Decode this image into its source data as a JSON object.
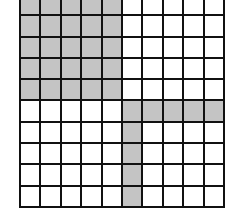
{
  "grid": {
    "rows": 10,
    "cols": 10,
    "line_color": "#111111",
    "empty_color": "#ffffff",
    "shaded_color": "#c4c4c4",
    "shaded_cells": [
      [
        0,
        0
      ],
      [
        0,
        1
      ],
      [
        0,
        2
      ],
      [
        0,
        3
      ],
      [
        0,
        4
      ],
      [
        1,
        0
      ],
      [
        1,
        1
      ],
      [
        1,
        2
      ],
      [
        1,
        3
      ],
      [
        1,
        4
      ],
      [
        2,
        0
      ],
      [
        2,
        1
      ],
      [
        2,
        2
      ],
      [
        2,
        3
      ],
      [
        2,
        4
      ],
      [
        3,
        0
      ],
      [
        3,
        1
      ],
      [
        3,
        2
      ],
      [
        3,
        3
      ],
      [
        3,
        4
      ],
      [
        4,
        0
      ],
      [
        4,
        1
      ],
      [
        4,
        2
      ],
      [
        4,
        3
      ],
      [
        4,
        4
      ],
      [
        5,
        5
      ],
      [
        5,
        6
      ],
      [
        5,
        7
      ],
      [
        5,
        8
      ],
      [
        5,
        9
      ],
      [
        6,
        5
      ],
      [
        7,
        5
      ],
      [
        8,
        5
      ],
      [
        9,
        5
      ]
    ],
    "shaded_count": 34,
    "total_cells": 100
  }
}
